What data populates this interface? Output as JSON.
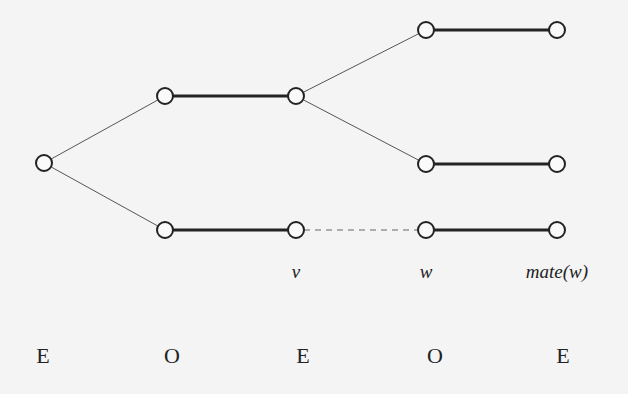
{
  "diagram": {
    "type": "alternating-tree",
    "colors": {
      "background": "#f4f4f4",
      "stroke": "#222222",
      "thin_edge": "#555555",
      "dashed_edge": "#666666"
    },
    "nodes": [
      {
        "id": "root",
        "x": 44,
        "y": 163
      },
      {
        "id": "o1",
        "x": 165,
        "y": 96
      },
      {
        "id": "e1",
        "x": 296,
        "y": 96
      },
      {
        "id": "o2",
        "x": 165,
        "y": 230
      },
      {
        "id": "v",
        "x": 296,
        "y": 230
      },
      {
        "id": "o3",
        "x": 426,
        "y": 30
      },
      {
        "id": "e3",
        "x": 557,
        "y": 30
      },
      {
        "id": "o4",
        "x": 426,
        "y": 164
      },
      {
        "id": "e4",
        "x": 557,
        "y": 164
      },
      {
        "id": "w",
        "x": 426,
        "y": 230
      },
      {
        "id": "mate_w",
        "x": 557,
        "y": 230
      }
    ],
    "edges": [
      {
        "from": "root",
        "to": "o1",
        "style": "thin"
      },
      {
        "from": "root",
        "to": "o2",
        "style": "thin"
      },
      {
        "from": "o1",
        "to": "e1",
        "style": "thick"
      },
      {
        "from": "o2",
        "to": "v",
        "style": "thick"
      },
      {
        "from": "e1",
        "to": "o3",
        "style": "thin"
      },
      {
        "from": "e1",
        "to": "o4",
        "style": "thin"
      },
      {
        "from": "o3",
        "to": "e3",
        "style": "thick"
      },
      {
        "from": "o4",
        "to": "e4",
        "style": "thick"
      },
      {
        "from": "v",
        "to": "w",
        "style": "dashed"
      },
      {
        "from": "w",
        "to": "mate_w",
        "style": "thick"
      }
    ],
    "vertex_labels": [
      {
        "text": "v",
        "x": 296,
        "y": 278
      },
      {
        "text": "w",
        "x": 426,
        "y": 278
      },
      {
        "text": "mate(w)",
        "x": 557,
        "y": 278
      }
    ],
    "parity_labels": [
      {
        "text": "E",
        "x": 43
      },
      {
        "text": "O",
        "x": 172
      },
      {
        "text": "E",
        "x": 303
      },
      {
        "text": "O",
        "x": 435
      },
      {
        "text": "E",
        "x": 563
      }
    ],
    "parity_row_y": 363
  }
}
